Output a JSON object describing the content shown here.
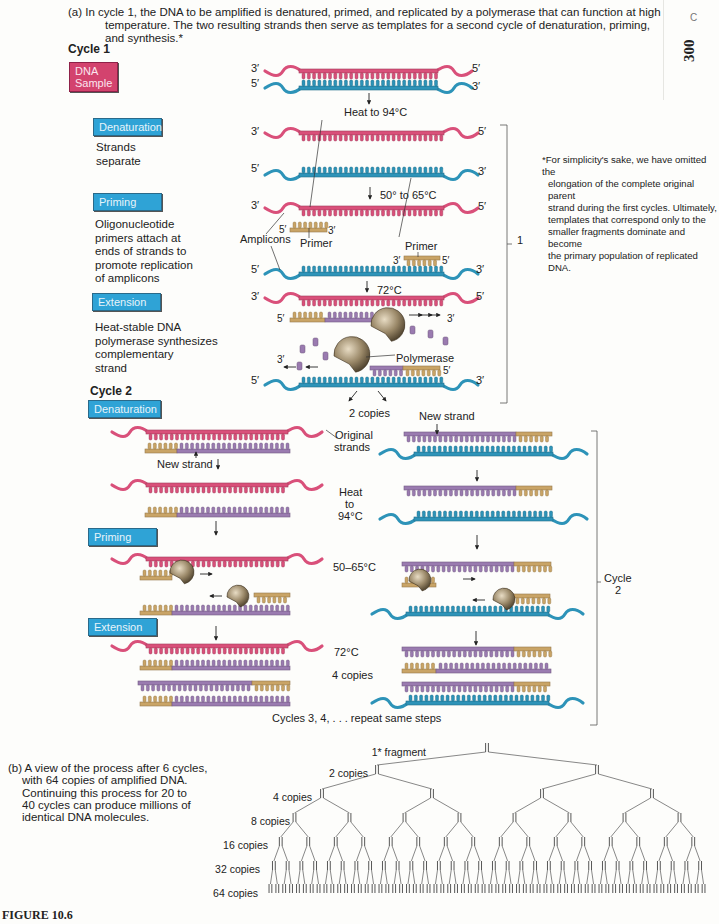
{
  "caption_a": {
    "line1": "(a) In cycle 1, the DNA to be amplified is denatured, primed, and replicated by a polymerase that can function at high",
    "line2": "temperature. The two resulting strands then serve as templates for a second cycle of denaturation, priming,",
    "line3": "and synthesis.*"
  },
  "margin": {
    "page_number": "300",
    "mark": "C"
  },
  "cycle1": {
    "heading": "Cycle 1",
    "steps": [
      {
        "tag": "DNA Sample",
        "color": "#d3436e"
      },
      {
        "tag": "Denaturation",
        "color": "#2fa3d6",
        "desc": [
          "Strands",
          "separate"
        ]
      },
      {
        "tag": "Priming",
        "color": "#2fa3d6",
        "desc": [
          "Oligonucleotide",
          "primers attach at",
          "ends of strands to",
          "promote replication",
          "of amplicons"
        ]
      },
      {
        "tag": "Extension",
        "color": "#2fa3d6",
        "desc": [
          "Heat-stable DNA",
          "polymerase synthesizes",
          "complementary",
          "strand"
        ]
      }
    ],
    "labels": {
      "heat": "Heat to 94°C",
      "anneal": "50° to 65°C",
      "extend": "72°C",
      "amplicons": "Amplicons",
      "primer": "Primer",
      "polymerase": "Polymerase",
      "copies": "2 copies",
      "three_prime": "3′",
      "five_prime": "5′"
    },
    "bracket_label": "1"
  },
  "footnote": {
    "lines": [
      "*For simplicity's sake, we have omitted the",
      "elongation of the complete original parent",
      "strand during the first cycles. Ultimately,",
      "templates that correspond only to the",
      "smaller fragments dominate and become",
      "the primary population of replicated DNA."
    ]
  },
  "cycle2": {
    "heading": "Cycle 2",
    "tags": [
      "Denaturation",
      "Priming",
      "Extension"
    ],
    "labels": {
      "new_strand": "New strand",
      "original_strands": [
        "Original",
        "strands"
      ],
      "heat": [
        "Heat",
        "to",
        "94°C"
      ],
      "anneal": "50–65°C",
      "extend": "72°C",
      "copies": "4 copies",
      "repeat": "Cycles 3, 4, . . . repeat same steps"
    },
    "bracket_label": [
      "Cycle",
      "2"
    ]
  },
  "caption_b": {
    "lines": [
      "(b) A view of the process after 6 cycles,",
      "with 64 copies of amplified DNA.",
      "Continuing this process for 20 to",
      "40 cycles can produce millions of",
      "identical DNA molecules."
    ]
  },
  "tree": {
    "levels": [
      {
        "label": "1* fragment",
        "count": 1
      },
      {
        "label": "2 copies",
        "count": 2
      },
      {
        "label": "4 copies",
        "count": 4
      },
      {
        "label": "8 copies",
        "count": 8
      },
      {
        "label": "16 copies",
        "count": 16
      },
      {
        "label": "32 copies",
        "count": 32
      },
      {
        "label": "64 copies",
        "count": 64
      }
    ]
  },
  "figure_label": "FIGURE 10.6",
  "colors": {
    "original_top": "#d9507a",
    "original_bottom": "#2d93b8",
    "primer": "#c9a466",
    "new_strand": "#9a7bb0",
    "polymerase": "#8a7a5e"
  }
}
